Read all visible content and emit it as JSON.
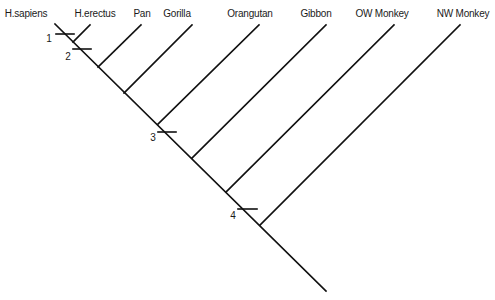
{
  "diagram": {
    "type": "cladogram",
    "line_color": "#111111",
    "taxa": [
      {
        "label": "H.sapiens",
        "label_x": 26,
        "top": [
          55,
          24
        ]
      },
      {
        "label": "H.erectus",
        "label_x": 95,
        "top": [
          90,
          25
        ],
        "join": [
          73,
          42
        ]
      },
      {
        "label": "Pan",
        "label_x": 142,
        "top": [
          141,
          25
        ],
        "join": [
          98,
          67
        ]
      },
      {
        "label": "Gorilla",
        "label_x": 177,
        "top": [
          192,
          25
        ],
        "join": [
          124,
          93
        ]
      },
      {
        "label": "Orangutan",
        "label_x": 250,
        "top": [
          259,
          25
        ],
        "join": [
          158,
          124
        ]
      },
      {
        "label": "Gibbon",
        "label_x": 316,
        "top": [
          326,
          25
        ],
        "join": [
          192,
          158
        ]
      },
      {
        "label": "OW Monkey",
        "label_x": 382,
        "top": [
          394,
          25
        ],
        "join": [
          226,
          192
        ]
      },
      {
        "label": "NW Monkey",
        "label_x": 463,
        "top": [
          460,
          25
        ],
        "join": [
          260,
          225
        ]
      }
    ],
    "trunk": {
      "start": [
        55,
        24
      ],
      "end": [
        326,
        291
      ]
    },
    "character_marks": [
      {
        "label": "1",
        "tick": [
          56,
          74,
          34
        ],
        "label_pos": [
          49,
          38
        ]
      },
      {
        "label": "2",
        "tick": [
          73,
          91,
          49
        ],
        "label_pos": [
          68,
          56
        ]
      },
      {
        "label": "3",
        "tick": [
          158,
          176,
          132
        ],
        "label_pos": [
          153,
          137
        ]
      },
      {
        "label": "4",
        "tick": [
          238,
          257,
          209
        ],
        "label_pos": [
          233,
          215
        ]
      }
    ]
  }
}
